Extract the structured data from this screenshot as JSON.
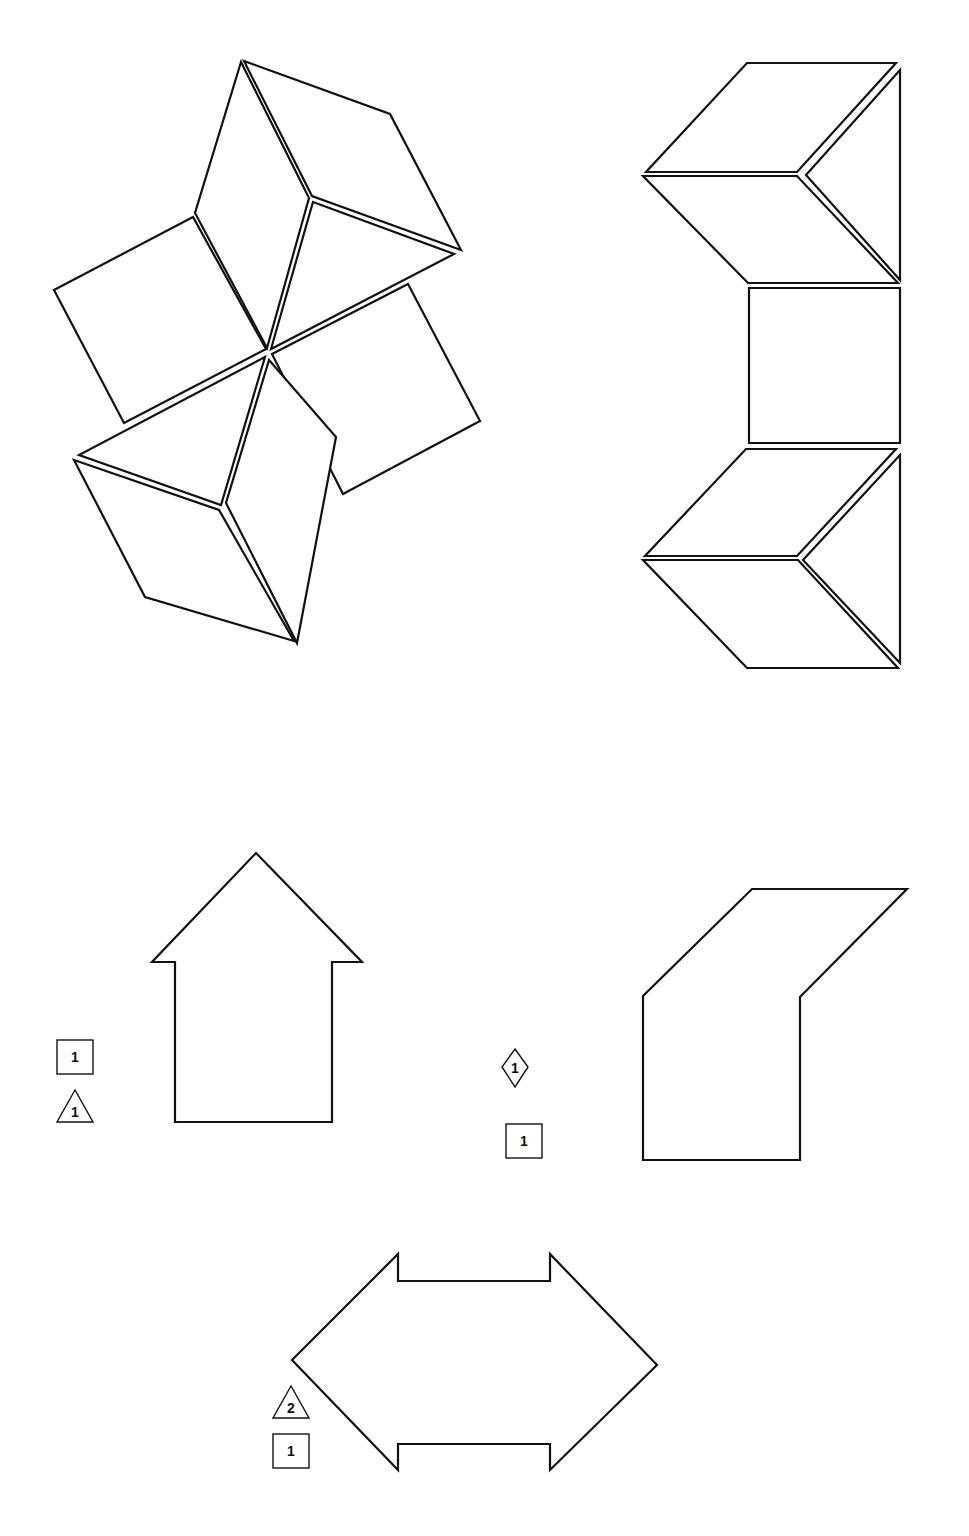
{
  "figure": {
    "header_fragment": "",
    "stroke_color": "#111111",
    "background": "#ffffff"
  },
  "puzzles": [
    {
      "id": "pinwheel",
      "description": "Pinwheel arrangement of rhombi, squares and triangles",
      "pieces": [
        {
          "type": "rhombus",
          "points": "241,62 195,213 267,348 309,198"
        },
        {
          "type": "rhombus",
          "points": "244,61 390,114 461,250 312,196"
        },
        {
          "type": "triangle",
          "points": "313,202 454,254 271,349"
        },
        {
          "type": "square",
          "points": "54,290 193,217 266,349 124,423"
        },
        {
          "type": "square",
          "points": "408,284 480,421 343,494 272,354"
        },
        {
          "type": "triangle",
          "points": "265,357 79,455 221,505"
        },
        {
          "type": "rhombus",
          "points": "74,460 219,510 294,641 145,597"
        },
        {
          "type": "rhombus",
          "points": "269,360 226,503 297,643 336,437"
        }
      ]
    },
    {
      "id": "column",
      "description": "Vertical column of rhombi, triangles and square",
      "pieces": [
        {
          "type": "rhombus",
          "points": "747,63 896,63 797,172 646,172"
        },
        {
          "type": "triangle",
          "points": "900,70 806,175 900,280"
        },
        {
          "type": "rhombus",
          "points": "643,176 797,176 898,283 748,283"
        },
        {
          "type": "square",
          "points": "749,288 900,288 900,443 749,443"
        },
        {
          "type": "rhombus",
          "points": "746,449 896,449 797,556 645,556"
        },
        {
          "type": "triangle",
          "points": "900,455 803,560 900,663"
        },
        {
          "type": "rhombus",
          "points": "643,560 798,560 898,668 747,668"
        }
      ]
    },
    {
      "id": "house",
      "description": "House/arrow outline",
      "outline": "256,853 362,962 332,962 332,1122 175,1122 175,962 152,962",
      "labels": [
        {
          "shape": "square",
          "count": "1",
          "x": 57,
          "y": 1040
        },
        {
          "shape": "triangle",
          "count": "1",
          "x": 57,
          "y": 1090
        }
      ]
    },
    {
      "id": "parallelogram-house",
      "description": "Slanted outline shape",
      "outline": "752,889 907,889 800,997 800,1160 643,1160 643,996",
      "labels": [
        {
          "shape": "diamond",
          "count": "1",
          "x": 515,
          "y": 1067
        },
        {
          "shape": "square",
          "count": "1",
          "x": 506,
          "y": 1124
        }
      ]
    },
    {
      "id": "double-arrow",
      "description": "Double-headed arrow outline",
      "outline": "398,1254 398,1281 550,1281 550,1254 657,1365 550,1470 550,1444 398,1444 398,1470 292,1360",
      "labels": [
        {
          "shape": "triangle",
          "count": "2",
          "x": 273,
          "y": 1386
        },
        {
          "shape": "square",
          "count": "1",
          "x": 273,
          "y": 1434
        }
      ]
    }
  ]
}
